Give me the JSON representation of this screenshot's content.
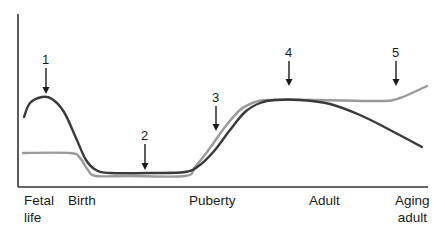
{
  "chart_data": {
    "type": "line",
    "title": "",
    "xlabel": "",
    "ylabel": "",
    "grid": false,
    "legend": null,
    "categories": [
      "Fetal life",
      "Birth",
      "Puberty",
      "Adult",
      "Aging adult"
    ],
    "x_tick_labels": [
      {
        "line1": "Fetal",
        "line2": "life"
      },
      {
        "line1": "Birth",
        "line2": ""
      },
      {
        "line1": "Puberty",
        "line2": ""
      },
      {
        "line1": "Adult",
        "line2": ""
      },
      {
        "line1": "Aging",
        "line2": "adult"
      }
    ],
    "series": [
      {
        "name": "dark-curve",
        "color": "#3a3a3a",
        "description": "High in fetal life, falls after birth, low in childhood, rises at puberty, plateaus in adult, declines in aging adult",
        "points": [
          [
            24,
            117
          ],
          [
            30,
            103
          ],
          [
            42,
            97
          ],
          [
            52,
            99
          ],
          [
            64,
            112
          ],
          [
            76,
            138
          ],
          [
            86,
            160
          ],
          [
            96,
            170
          ],
          [
            110,
            173
          ],
          [
            150,
            173
          ],
          [
            185,
            172
          ],
          [
            200,
            165
          ],
          [
            215,
            150
          ],
          [
            230,
            130
          ],
          [
            245,
            112
          ],
          [
            260,
            103
          ],
          [
            275,
            100
          ],
          [
            300,
            100
          ],
          [
            330,
            104
          ],
          [
            360,
            115
          ],
          [
            390,
            130
          ],
          [
            422,
            147
          ]
        ]
      },
      {
        "name": "gray-curve",
        "color": "#9a9a9a",
        "description": "Moderate in fetal life, falls after birth, low in childhood, rises at puberty, plateaus through adult and aging adult with slight late rise",
        "points": [
          [
            23,
            153
          ],
          [
            70,
            153
          ],
          [
            80,
            158
          ],
          [
            88,
            170
          ],
          [
            96,
            176
          ],
          [
            130,
            176
          ],
          [
            185,
            176
          ],
          [
            195,
            167
          ],
          [
            210,
            148
          ],
          [
            225,
            127
          ],
          [
            240,
            110
          ],
          [
            255,
            102
          ],
          [
            270,
            100
          ],
          [
            320,
            100
          ],
          [
            380,
            101
          ],
          [
            400,
            98
          ],
          [
            427,
            86
          ]
        ]
      }
    ],
    "annotations": [
      {
        "label": "1",
        "x": 46,
        "label_y": 60,
        "arrow_from": 68,
        "arrow_to": 94
      },
      {
        "label": "2",
        "x": 145,
        "label_y": 136,
        "arrow_from": 144,
        "arrow_to": 170
      },
      {
        "label": "3",
        "x": 216,
        "label_y": 98,
        "arrow_from": 106,
        "arrow_to": 131
      },
      {
        "label": "4",
        "x": 289,
        "label_y": 53,
        "arrow_from": 61,
        "arrow_to": 86
      },
      {
        "label": "5",
        "x": 396,
        "label_y": 53,
        "arrow_from": 61,
        "arrow_to": 86
      }
    ],
    "axes": {
      "color": "#333333",
      "y_axis_x": 18,
      "top": 14,
      "x_axis_y": 187,
      "right": 428
    }
  }
}
